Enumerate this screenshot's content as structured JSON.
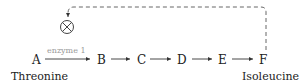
{
  "pathway": {
    "nodes": [
      "A",
      "B",
      "C",
      "D",
      "E",
      "F"
    ],
    "start_label": "Threonine",
    "end_label": "Isoleucine",
    "enzyme_label": "enzyme 1",
    "inhibition_symbol": "inhibition-x-circle",
    "feedback": "dashed line from F back to enzyme 1 (feedback inhibition)"
  },
  "colors": {
    "text": "#222222",
    "enzyme_text": "#999999",
    "lines": "#333333",
    "dashed": "#555555"
  }
}
